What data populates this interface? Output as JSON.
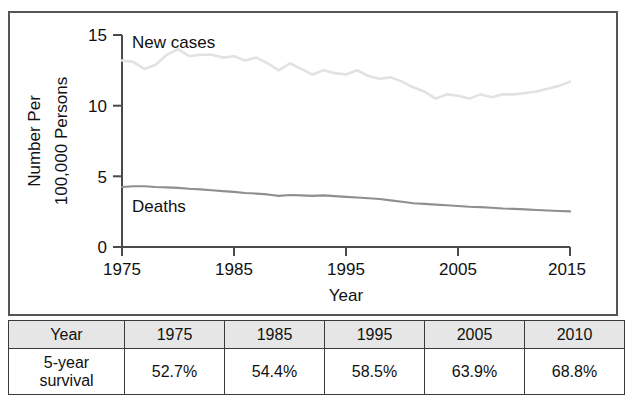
{
  "figure": {
    "name": "cancer-incidence-mortality-figure"
  },
  "chart_data": {
    "type": "line",
    "title": "",
    "xlabel": "Year",
    "ylabel": "Number Per 100,000 Persons",
    "ylabel_lines": [
      "Number Per",
      "100,000 Persons"
    ],
    "xlim": [
      1975,
      2015
    ],
    "ylim": [
      0,
      15
    ],
    "xticks": [
      "1975",
      "1985",
      "1995",
      "2005",
      "2015"
    ],
    "xtick_values": [
      1975,
      1985,
      1995,
      2005,
      2015
    ],
    "yticks": [
      "0",
      "5",
      "10",
      "15"
    ],
    "ytick_values": [
      0,
      5,
      10,
      15
    ],
    "grid": false,
    "legend": "inline-annotations",
    "x": [
      1975,
      1976,
      1977,
      1978,
      1979,
      1980,
      1981,
      1982,
      1983,
      1984,
      1985,
      1986,
      1987,
      1988,
      1989,
      1990,
      1991,
      1992,
      1993,
      1994,
      1995,
      1996,
      1997,
      1998,
      1999,
      2000,
      2001,
      2002,
      2003,
      2004,
      2005,
      2006,
      2007,
      2008,
      2009,
      2010,
      2011,
      2012,
      2013,
      2014,
      2015
    ],
    "series": [
      {
        "name": "New cases",
        "color": "#e2e2e2",
        "label_position": {
          "x": 1976.5,
          "y": 14.6
        },
        "values": [
          13.2,
          13.1,
          12.6,
          12.9,
          13.6,
          14.0,
          13.5,
          13.6,
          13.6,
          13.4,
          13.5,
          13.2,
          13.4,
          13.0,
          12.5,
          13.0,
          12.6,
          12.2,
          12.5,
          12.3,
          12.2,
          12.5,
          12.1,
          11.9,
          12.0,
          11.7,
          11.3,
          11.0,
          10.5,
          10.8,
          10.7,
          10.5,
          10.8,
          10.6,
          10.8,
          10.8,
          10.9,
          11.0,
          11.2,
          11.4,
          11.7
        ]
      },
      {
        "name": "Deaths",
        "color": "#8f8f8f",
        "label_position": {
          "x": 1977.2,
          "y": 3.35
        },
        "values": [
          4.25,
          4.3,
          4.3,
          4.25,
          4.22,
          4.18,
          4.12,
          4.08,
          4.02,
          3.95,
          3.9,
          3.82,
          3.78,
          3.72,
          3.62,
          3.68,
          3.65,
          3.62,
          3.65,
          3.6,
          3.55,
          3.5,
          3.45,
          3.4,
          3.3,
          3.2,
          3.1,
          3.05,
          3.0,
          2.95,
          2.9,
          2.85,
          2.82,
          2.78,
          2.72,
          2.7,
          2.66,
          2.62,
          2.58,
          2.55,
          2.52
        ]
      }
    ]
  },
  "table": {
    "name": "five-year-survival-table",
    "header": [
      "Year",
      "1975",
      "1985",
      "1995",
      "2005",
      "2010"
    ],
    "rows": [
      {
        "label_line1": "5-year",
        "label_line2": "survival",
        "values": [
          "52.7%",
          "54.4%",
          "58.5%",
          "63.9%",
          "68.8%"
        ]
      }
    ]
  }
}
